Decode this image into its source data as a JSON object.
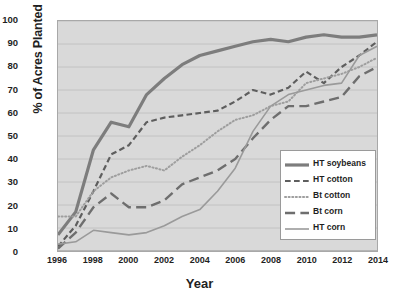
{
  "chart_data": {
    "type": "line",
    "title": "",
    "xlabel": "Year",
    "ylabel": "% of Acres Planted",
    "xlim": [
      1996,
      2014
    ],
    "ylim": [
      0,
      100
    ],
    "grid": "horizontal",
    "legend_position": "lower-right",
    "x": [
      1996,
      1997,
      1998,
      1999,
      2000,
      2001,
      2002,
      2003,
      2004,
      2005,
      2006,
      2007,
      2008,
      2009,
      2010,
      2011,
      2012,
      2013,
      2014
    ],
    "y_ticks": [
      "0",
      "10",
      "20",
      "30",
      "40",
      "50",
      "60",
      "70",
      "80",
      "90",
      "100"
    ],
    "x_ticks": [
      "1996",
      "1998",
      "2000",
      "2002",
      "2004",
      "2006",
      "2008",
      "2010",
      "2012",
      "2014"
    ],
    "series": [
      {
        "name": "HT soybeans",
        "style": "solid-thick",
        "color": "#7d7d7d",
        "width": 3.2,
        "values": [
          7,
          17,
          44,
          56,
          54,
          68,
          75,
          81,
          85,
          87,
          89,
          91,
          92,
          91,
          93,
          94,
          93,
          93,
          94
        ]
      },
      {
        "name": "HT cotton",
        "style": "dashed",
        "color": "#5e5e5e",
        "width": 2.2,
        "values": [
          2,
          11,
          26,
          42,
          46,
          56,
          58,
          59,
          60,
          61,
          65,
          70,
          68,
          71,
          78,
          73,
          80,
          85,
          91
        ]
      },
      {
        "name": "Bt cotton",
        "style": "dotted",
        "color": "#9e9e9e",
        "width": 2.0,
        "values": [
          15,
          15,
          26,
          32,
          35,
          37,
          35,
          41,
          46,
          52,
          57,
          59,
          63,
          65,
          73,
          75,
          77,
          80,
          84
        ]
      },
      {
        "name": "Bt corn",
        "style": "long-dash",
        "color": "#6e6e6e",
        "width": 2.4,
        "values": [
          1,
          8,
          19,
          25,
          19,
          19,
          22,
          29,
          32,
          35,
          40,
          49,
          57,
          63,
          63,
          65,
          67,
          76,
          80
        ]
      },
      {
        "name": "HT corn",
        "style": "solid-thin",
        "color": "#9a9a9a",
        "width": 1.6,
        "values": [
          3,
          4,
          9,
          8,
          7,
          8,
          11,
          15,
          18,
          26,
          36,
          52,
          63,
          68,
          70,
          72,
          73,
          85,
          89
        ]
      }
    ]
  }
}
